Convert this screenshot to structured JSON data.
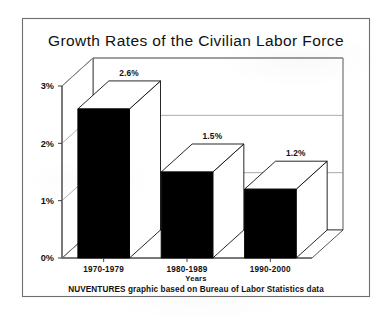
{
  "title": "Growth Rates of the Civilian Labor Force",
  "footer": "NUVENTURES graphic based on Bureau of Labor Statistics data",
  "chart_data": {
    "type": "bar",
    "title": "Growth Rates of the Civilian Labor Force",
    "subtitle": "Annual Growth Rates",
    "xlabel": "Years",
    "ylabel": "Annual Growth Rates",
    "categories": [
      "1970-1979",
      "1980-1989",
      "1990-2000"
    ],
    "values": [
      2.6,
      1.5,
      1.2
    ],
    "data_labels": [
      "2.6%",
      "1.5%",
      "1.2%"
    ],
    "ylim": [
      0,
      3
    ],
    "ytick_values": [
      0,
      1,
      2,
      3
    ],
    "ytick_labels": [
      "0%",
      "1%",
      "2%",
      "3%"
    ],
    "grid": true,
    "legend": false,
    "style": "3d-column",
    "bar_color": "#000000",
    "bar_top_color": "#ffffff",
    "bar_side_color": "#ffffff",
    "note": "NUVENTURES graphic based on Bureau of Labor Statistics data"
  }
}
